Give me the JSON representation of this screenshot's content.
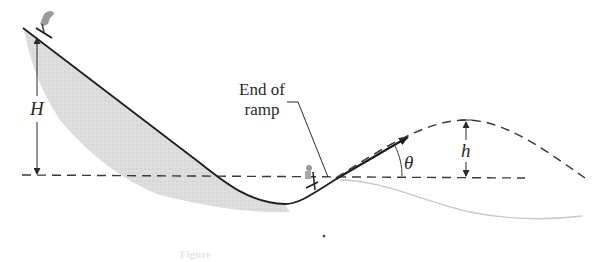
{
  "figure": {
    "type": "physics-diagram",
    "labels": {
      "ramp_line1": "End of",
      "ramp_line2": "ramp",
      "H": "H",
      "h": "h",
      "theta": "θ"
    },
    "caption": "Figure"
  },
  "colors": {
    "line": "#1e1e1e",
    "dashed": "#3a3a3a",
    "slope_fill": "#d7d7d7",
    "faint_curve": "#c8c8c8"
  }
}
